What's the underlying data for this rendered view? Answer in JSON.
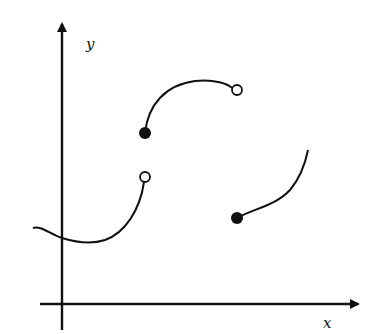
{
  "figure": {
    "axes": {
      "x_label": "x",
      "y_label": "y"
    },
    "colors": {
      "stroke": "#111111",
      "background": "#ffffff"
    },
    "pieces": [
      {
        "name": "piece-1",
        "description": "Curve entering from the left, dipping to a minimum just right of the y-axis, rising to an open endpoint",
        "start": {
          "x": 33,
          "y": 228,
          "marker": "none"
        },
        "end": {
          "x": 145,
          "y": 177,
          "marker": "open-circle"
        }
      },
      {
        "name": "piece-2",
        "description": "Concave-down arc starting at filled point, rising then leveling to an open endpoint",
        "start": {
          "x": 145,
          "y": 133,
          "marker": "filled-dot"
        },
        "end": {
          "x": 237,
          "y": 90,
          "marker": "open-circle"
        }
      },
      {
        "name": "piece-3",
        "description": "Increasing concave-up curve starting at filled point",
        "start": {
          "x": 237,
          "y": 218,
          "marker": "filled-dot"
        },
        "end": {
          "x": 308,
          "y": 150,
          "marker": "none"
        }
      }
    ]
  }
}
